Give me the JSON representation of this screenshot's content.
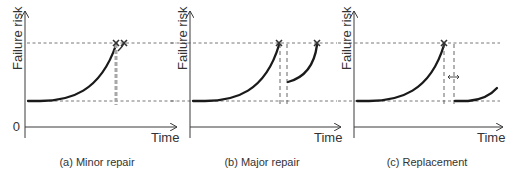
{
  "diagram": {
    "panels": [
      {
        "id": "a",
        "caption": "(a) Minor repair",
        "y_label": "Failure risk",
        "x_label": "Time",
        "origin_label": "0"
      },
      {
        "id": "b",
        "caption": "(b) Major repair",
        "y_label": "Failure risk",
        "x_label": "Time"
      },
      {
        "id": "c",
        "caption": "(c) Replacement",
        "y_label": "Failure risk",
        "x_label": "Time"
      }
    ],
    "icons": {
      "failure_marker": "x-mark-icon",
      "interval_marker": "double-arrow-icon"
    },
    "colors": {
      "curve": "#1a1a1a",
      "axis": "#3a3a3a",
      "repair_line": "#a8a8a8"
    }
  }
}
